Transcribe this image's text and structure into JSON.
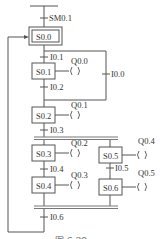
{
  "diagram": {
    "type": "sequential-function-chart",
    "initial_transition": "SM0.1",
    "initial_step": "S0.0",
    "steps": [
      {
        "id": "S0.0",
        "initial": true,
        "action": null
      },
      {
        "id": "S0.1",
        "action": "Q0.0"
      },
      {
        "id": "S0.2",
        "action": "Q0.1"
      },
      {
        "id": "S0.3",
        "action": "Q0.2"
      },
      {
        "id": "S0.4",
        "action": "Q0.3"
      },
      {
        "id": "S0.5",
        "action": "Q0.4"
      },
      {
        "id": "S0.6",
        "action": "Q0.5"
      }
    ],
    "transitions": {
      "t_init": "SM0.1",
      "t_s0_s1": "I0.1",
      "t_s0_skip": "I0.0",
      "t_s1_s2": "I0.2",
      "t_s2_par": "I0.3",
      "t_s3_s4": "I0.4",
      "t_s5_s6": "I0.5",
      "t_par_s0": "I0.6"
    },
    "coil_symbol": "( )",
    "caption": "图 6-29"
  }
}
